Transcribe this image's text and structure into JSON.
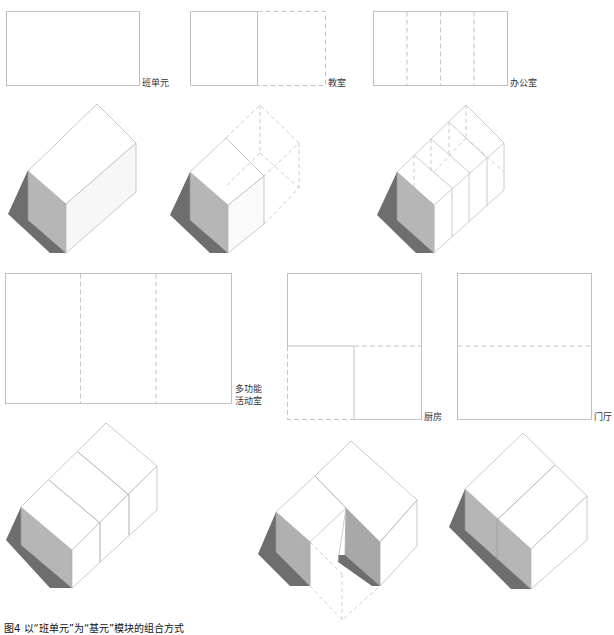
{
  "figure": {
    "caption": "图4  以“班单元”为“基元”模块的组合方式"
  },
  "colors": {
    "line": "#bdbdbd",
    "dash": "#c4c4c4",
    "side_face": "#b5b5b5",
    "shadow": "#6a6a6a",
    "top_face": "#ffffff"
  },
  "plans": [
    {
      "id": "class-unit",
      "label": "班单元"
    },
    {
      "id": "classroom",
      "label": "教室"
    },
    {
      "id": "office",
      "label": "办公室"
    },
    {
      "id": "multi-purpose",
      "label": "多功能\n活动室"
    },
    {
      "id": "kitchen",
      "label": "厨房"
    },
    {
      "id": "lobby",
      "label": "门厅"
    }
  ]
}
